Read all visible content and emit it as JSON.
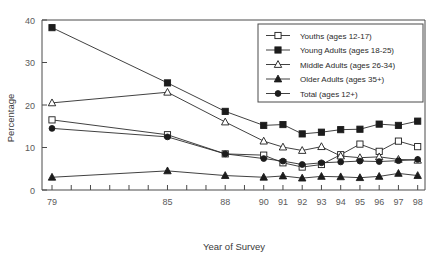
{
  "chart_data": {
    "type": "line",
    "title": "",
    "xlabel": "Year of Survey",
    "ylabel": "Percentage",
    "ylim": [
      0,
      40
    ],
    "yticks": [
      0,
      10,
      20,
      30,
      40
    ],
    "ytick_labels": [
      "0",
      "10",
      "20",
      "30",
      "40"
    ],
    "grid": false,
    "legend_position": "upper right",
    "x": [
      "79",
      "85",
      "88",
      "90",
      "91",
      "92",
      "93",
      "94",
      "95",
      "96",
      "97",
      "98"
    ],
    "xtick_labels": [
      "79",
      "",
      "",
      "",
      "",
      "",
      "85",
      "",
      "",
      "88",
      "",
      "90",
      "91",
      "92",
      "93",
      "94",
      "95",
      "96",
      "97",
      "98"
    ],
    "xtick_all_years": [
      "79",
      "80",
      "81",
      "82",
      "83",
      "84",
      "85",
      "86",
      "87",
      "88",
      "89",
      "90",
      "91",
      "92",
      "93",
      "94",
      "95",
      "96",
      "97",
      "98"
    ],
    "series": [
      {
        "name": "Youths (ages 12-17)",
        "marker": "open-square",
        "values": [
          16.5,
          13.0,
          8.5,
          8.2,
          6.4,
          5.4,
          6.0,
          8.3,
          10.8,
          9.1,
          11.5,
          10.2
        ]
      },
      {
        "name": "Young Adults (ages 18-25)",
        "marker": "filled-square",
        "values": [
          38.2,
          25.2,
          18.5,
          15.2,
          15.4,
          13.2,
          13.6,
          14.2,
          14.3,
          15.5,
          15.2,
          16.2
        ]
      },
      {
        "name": "Middle Adults (ages 26-34)",
        "marker": "open-triangle",
        "values": [
          20.5,
          23.0,
          16.0,
          11.5,
          10.1,
          9.3,
          10.2,
          8.0,
          7.6,
          7.8,
          7.2,
          7.0
        ]
      },
      {
        "name": "Older Adults (ages 35+)",
        "marker": "filled-triangle",
        "values": [
          3.0,
          4.5,
          3.4,
          3.0,
          3.3,
          2.8,
          3.2,
          3.1,
          2.9,
          3.2,
          3.9,
          3.4
        ]
      },
      {
        "name": "Total (ages 12+)",
        "marker": "filled-circle",
        "values": [
          14.5,
          12.5,
          8.5,
          7.4,
          6.8,
          6.0,
          6.4,
          6.6,
          6.8,
          6.7,
          6.9,
          7.2
        ]
      }
    ]
  },
  "legend": {
    "entries": [
      {
        "label": "Youths (ages 12-17)"
      },
      {
        "label": "Young Adults (ages 18-25)"
      },
      {
        "label": "Middle Adults (ages 26-34)"
      },
      {
        "label": "Older Adults (ages 35+)"
      },
      {
        "label": "Total (ages 12+)"
      }
    ]
  },
  "axes": {
    "y_title": "Percentage",
    "x_title": "Year of Survey"
  }
}
